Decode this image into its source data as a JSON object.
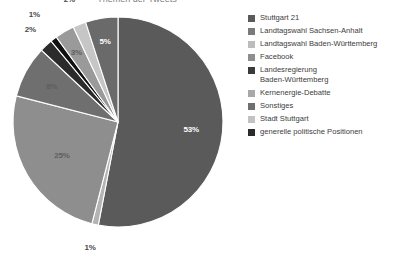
{
  "chart": {
    "title_cutoff": "Themen der Tweets",
    "pie": {
      "center_x": 118,
      "center_y": 114,
      "radius": 105
    }
  },
  "chart_data": {
    "type": "pie",
    "title": "",
    "xlabel": "",
    "ylabel": "",
    "legend_position": "right",
    "grid": false,
    "start_angle_deg": 0,
    "direction": "clockwise",
    "categories": [
      "Stuttgart 21",
      "Landtagswahl Sachsen-Anhalt",
      "Landtagswahl Baden-Württemberg",
      "Facebook",
      "Landesregierung Baden-Württemberg",
      "Kernenergie-Debatte",
      "Sonstiges",
      "Stadt Stuttgart",
      "generelle politische Positionen"
    ],
    "values": [
      53,
      1,
      25,
      8,
      2,
      1,
      3,
      2,
      5
    ],
    "value_labels": [
      "53%",
      "1%",
      "25%",
      "8%",
      "2%",
      "1%",
      "3%",
      "2%",
      "5%"
    ],
    "colors": [
      "#5a5a5a",
      "#b4b4b4",
      "#8e8e8e",
      "#6f6f6f",
      "#2b2b2b",
      "#111111",
      "#9a9a9a",
      "#c6c6c6",
      "#6a6a6a"
    ],
    "slices": [
      {
        "label": "Stuttgart 21",
        "value": 53,
        "display": "53%",
        "color": "#5a5a5a"
      },
      {
        "label": "Landtagswahl Sachsen-Anhalt",
        "value": 1,
        "display": "1%",
        "color": "#b4b4b4"
      },
      {
        "label": "Landtagswahl Baden-Württemberg",
        "value": 25,
        "display": "25%",
        "color": "#8e8e8e"
      },
      {
        "label": "Facebook",
        "value": 8,
        "display": "8%",
        "color": "#6f6f6f"
      },
      {
        "label": "Landesregierung Baden-Württemberg",
        "value": 2,
        "display": "2%",
        "color": "#2b2b2b"
      },
      {
        "label": "Kernenergie-Debatte",
        "value": 1,
        "display": "1%",
        "color": "#111111"
      },
      {
        "label": "Sonstiges",
        "value": 3,
        "display": "3%",
        "color": "#9a9a9a"
      },
      {
        "label": "Stadt Stuttgart",
        "value": 2,
        "display": "2%",
        "color": "#c6c6c6"
      },
      {
        "label": "generelle politische Positionen",
        "value": 5,
        "display": "5%",
        "color": "#6a6a6a"
      }
    ]
  },
  "labels": {
    "p53": "53%",
    "p1a": "1%",
    "p25": "25%",
    "p8": "8%",
    "p2a": "2%",
    "p1b": "1%",
    "p3": "3%",
    "p2b": "2%",
    "p5": "5%"
  },
  "legend": {
    "items": [
      {
        "label": "Stuttgart 21",
        "color": "#5a5a5a"
      },
      {
        "label": "Landtagswahl Sachsen-Anhalt",
        "color": "#7a7a7a"
      },
      {
        "label": "Landtagswahl Baden-Württemberg",
        "color": "#bcbcbc"
      },
      {
        "label": "Facebook",
        "color": "#8e8e8e"
      },
      {
        "label": "Landesregierung\nBaden-Württemberg",
        "color": "#3a3a3a"
      },
      {
        "label": "Kernenergie-Debatte",
        "color": "#a8a8a8"
      },
      {
        "label": "Sonstiges",
        "color": "#6f6f6f"
      },
      {
        "label": "Stadt Stuttgart",
        "color": "#c2c2c2"
      },
      {
        "label": "generelle politische Positionen",
        "color": "#2b2b2b"
      }
    ]
  }
}
